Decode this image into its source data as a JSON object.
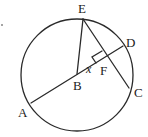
{
  "diagram": {
    "type": "circle-geometry",
    "circle": {
      "center_label": "B",
      "cx": 77,
      "cy": 75,
      "r": 56
    },
    "points": {
      "E": {
        "label": "E",
        "x": 83,
        "y": 19
      },
      "D": {
        "label": "D",
        "x": 123,
        "y": 46
      },
      "C": {
        "label": "C",
        "x": 129,
        "y": 88
      },
      "A": {
        "label": "A",
        "x": 31,
        "y": 103
      },
      "B": {
        "label": "B",
        "x": 77,
        "y": 74
      },
      "F": {
        "label": "F",
        "x": 106,
        "y": 57
      }
    },
    "segments": [
      {
        "from": "A",
        "to": "D",
        "name": "diameter-AD"
      },
      {
        "from": "B",
        "to": "E",
        "name": "radius-BE"
      },
      {
        "from": "E",
        "to": "C",
        "name": "chord-EC"
      }
    ],
    "angle_label": "x",
    "right_angle_at": "F",
    "labels": {
      "E": "E",
      "D": "D",
      "F": "F",
      "x": "x",
      "B": "B",
      "C": "C",
      "A": "A"
    },
    "stray_mark": "."
  }
}
